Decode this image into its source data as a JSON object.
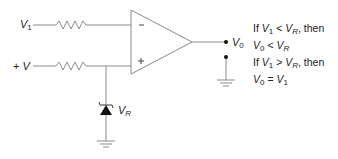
{
  "diagram": {
    "inputs": {
      "v1": {
        "symbol": "V",
        "sub": "1"
      },
      "vplus": {
        "prefix": "+ ",
        "symbol": "V"
      }
    },
    "opamp": {
      "inverting_sign": "−",
      "noninverting_sign": "+"
    },
    "output": {
      "symbol": "V",
      "sub": "0"
    },
    "zener": {
      "symbol": "V",
      "sub": "R"
    },
    "conditions": [
      {
        "parts": [
          "If ",
          "V",
          "1",
          " < ",
          "V",
          "R",
          ", then"
        ]
      },
      {
        "parts": [
          "V",
          "0",
          " < ",
          "V",
          "R"
        ]
      },
      {
        "parts": [
          "If ",
          "V",
          "1",
          " > ",
          "V",
          "R",
          ", then"
        ]
      },
      {
        "parts": [
          "V",
          "0",
          " = ",
          "V",
          "1"
        ]
      }
    ],
    "colors": {
      "line": "#8a8a8a",
      "text": "#222222",
      "fill": "#111111"
    }
  }
}
